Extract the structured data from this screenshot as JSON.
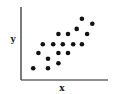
{
  "chart_data": {
    "type": "scatter",
    "title": "",
    "xlabel": "x",
    "ylabel": "y",
    "xlim": [
      0,
      10
    ],
    "ylim": [
      0,
      10
    ],
    "grid": false,
    "legend": "none",
    "x_ticks": [],
    "y_ticks": [],
    "series": [
      {
        "name": "points",
        "color": "#111111",
        "points": [
          {
            "x": 1.4,
            "y": 1.6
          },
          {
            "x": 3.1,
            "y": 1.6
          },
          {
            "x": 3.1,
            "y": 2.9
          },
          {
            "x": 4.3,
            "y": 2.3
          },
          {
            "x": 2.0,
            "y": 3.7
          },
          {
            "x": 4.3,
            "y": 3.7
          },
          {
            "x": 5.4,
            "y": 3.7
          },
          {
            "x": 2.5,
            "y": 4.9
          },
          {
            "x": 3.7,
            "y": 4.9
          },
          {
            "x": 4.8,
            "y": 4.9
          },
          {
            "x": 6.0,
            "y": 4.9
          },
          {
            "x": 7.0,
            "y": 4.9
          },
          {
            "x": 4.3,
            "y": 6.3
          },
          {
            "x": 5.4,
            "y": 6.3
          },
          {
            "x": 7.6,
            "y": 6.3
          },
          {
            "x": 6.4,
            "y": 7.0
          },
          {
            "x": 8.2,
            "y": 7.7
          },
          {
            "x": 7.0,
            "y": 8.4
          }
        ]
      }
    ]
  }
}
